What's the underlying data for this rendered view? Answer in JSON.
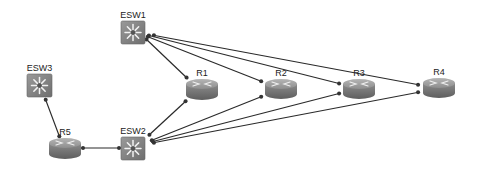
{
  "diagram": {
    "type": "network-topology",
    "nodes": [
      {
        "id": "ESW1",
        "label": "ESW1",
        "kind": "switch",
        "icon": "switch-icon",
        "x": 121,
        "y": 21,
        "w": 24,
        "h": 23
      },
      {
        "id": "ESW2",
        "label": "ESW2",
        "kind": "switch",
        "icon": "switch-icon",
        "x": 121,
        "y": 137,
        "w": 24,
        "h": 23
      },
      {
        "id": "ESW3",
        "label": "ESW3",
        "kind": "switch",
        "icon": "switch-icon",
        "x": 27,
        "y": 74,
        "w": 25,
        "h": 23
      },
      {
        "id": "R1",
        "label": "R1",
        "kind": "router",
        "icon": "router-icon",
        "x": 186,
        "y": 79,
        "w": 32,
        "h": 21
      },
      {
        "id": "R2",
        "label": "R2",
        "kind": "router",
        "icon": "router-icon",
        "x": 265,
        "y": 79,
        "w": 32,
        "h": 20
      },
      {
        "id": "R3",
        "label": "R3",
        "kind": "router",
        "icon": "router-icon",
        "x": 343,
        "y": 79,
        "w": 32,
        "h": 20
      },
      {
        "id": "R4",
        "label": "R4",
        "kind": "router",
        "icon": "router-icon",
        "x": 423,
        "y": 78,
        "w": 32,
        "h": 20
      },
      {
        "id": "R5",
        "label": "R5",
        "kind": "router",
        "icon": "router-icon",
        "x": 49,
        "y": 138,
        "w": 32,
        "h": 21
      }
    ],
    "links": [
      {
        "from": "ESW1",
        "to": "R1",
        "x1": 145,
        "y1": 38,
        "x2": 188,
        "y2": 79
      },
      {
        "from": "ESW1",
        "to": "R2",
        "x1": 146,
        "y1": 36,
        "x2": 263,
        "y2": 82
      },
      {
        "from": "ESW1",
        "to": "R3",
        "x1": 147,
        "y1": 35,
        "x2": 341,
        "y2": 84
      },
      {
        "from": "ESW1",
        "to": "R4",
        "x1": 152,
        "y1": 35,
        "x2": 420,
        "y2": 85
      },
      {
        "from": "ESW2",
        "to": "R1",
        "x1": 148,
        "y1": 136,
        "x2": 187,
        "y2": 100
      },
      {
        "from": "ESW2",
        "to": "R2",
        "x1": 150,
        "y1": 141,
        "x2": 263,
        "y2": 96
      },
      {
        "from": "ESW2",
        "to": "R3",
        "x1": 151,
        "y1": 142,
        "x2": 341,
        "y2": 93
      },
      {
        "from": "ESW2",
        "to": "R4",
        "x1": 152,
        "y1": 143,
        "x2": 420,
        "y2": 92
      },
      {
        "from": "ESW3",
        "to": "R5",
        "x1": 45,
        "y1": 98,
        "x2": 60,
        "y2": 138
      },
      {
        "from": "R5",
        "to": "ESW2",
        "x1": 81,
        "y1": 148,
        "x2": 121,
        "y2": 148
      }
    ],
    "colors": {
      "switch_fill": "#8a8a8a",
      "router_fill": "#8f8f8f",
      "link": "#2a2a2a",
      "background": "#ffffff"
    }
  }
}
